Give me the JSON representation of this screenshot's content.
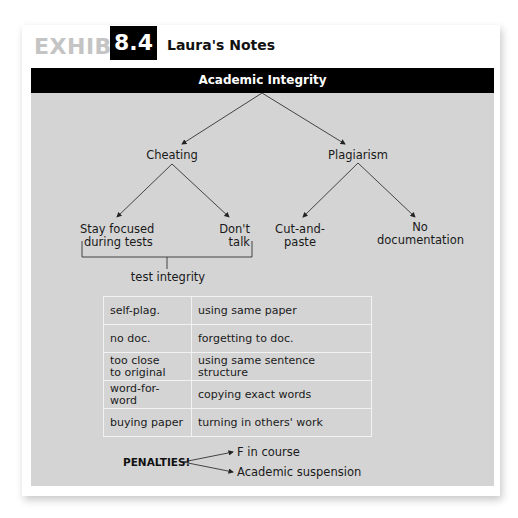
{
  "exhibit": {
    "label": "EXHIBIT",
    "number": "8.4",
    "title": "Laura's Notes"
  },
  "tree": {
    "root": "Academic Integrity",
    "branches": [
      {
        "label": "Cheating",
        "children": [
          "Stay focused during tests",
          "Don't talk"
        ],
        "children_lines": [
          [
            "Stay focused",
            "during tests"
          ],
          [
            "Don't",
            "talk"
          ]
        ],
        "group_label": "test integrity"
      },
      {
        "label": "Plagiarism",
        "children": [
          "Cut-and-paste",
          "No documentation"
        ],
        "children_lines": [
          [
            "Cut-and-",
            "paste"
          ],
          [
            "No",
            "documentation"
          ]
        ]
      }
    ]
  },
  "table": {
    "rows": [
      {
        "term": "self-plag.",
        "meaning": "using same paper"
      },
      {
        "term": "no doc.",
        "meaning": "forgetting to doc."
      },
      {
        "term": "too close to original",
        "term_lines": [
          "too close",
          "to original"
        ],
        "meaning": "using same sentence structure"
      },
      {
        "term": "word-for-word",
        "meaning": "copying exact words"
      },
      {
        "term": "buying paper",
        "meaning": "turning in others' work"
      }
    ]
  },
  "penalties": {
    "label": "PENALTIES!",
    "items": [
      "F in course",
      "Academic suspension"
    ]
  },
  "colors": {
    "panel": "#d4d4d4",
    "bar": "#000000",
    "exhibit_word": "#c4c4c4"
  }
}
